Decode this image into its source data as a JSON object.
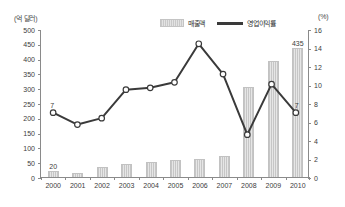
{
  "axis_unit_left": "(억 달러)",
  "axis_unit_right": "(%)",
  "legend": {
    "bar_label": "매출액",
    "line_label": "영업이익률"
  },
  "annotations": {
    "bar_first": "20",
    "bar_last": "435",
    "point_first": "7",
    "point_last": "7"
  },
  "colors": {
    "bar_fill": "#dcdcdc",
    "bar_border": "#c2c2c2",
    "line": "#3a3a3a",
    "marker_fill": "#ffffff",
    "axis": "#8a8a8a",
    "text": "#3c3c3c",
    "background": "#ffffff"
  },
  "chart_data": {
    "type": "bar",
    "title": "",
    "subtitle": "",
    "xlabel": "",
    "ylabel": "(억 달러)",
    "ylabel_secondary": "(%)",
    "grid": false,
    "legend_position": "top",
    "categories": [
      "2000",
      "2001",
      "2002",
      "2003",
      "2004",
      "2005",
      "2006",
      "2007",
      "2008",
      "2009",
      "2010"
    ],
    "ylim": [
      0,
      500
    ],
    "yticks": [
      0,
      50,
      100,
      150,
      200,
      250,
      300,
      350,
      400,
      450,
      500
    ],
    "ylim_secondary": [
      0,
      16
    ],
    "yticks_secondary": [
      0,
      2,
      4,
      6,
      8,
      10,
      12,
      14,
      16
    ],
    "series": [
      {
        "name": "매출액",
        "type": "bar",
        "axis": "left",
        "unit": "억 달러",
        "values": [
          20,
          15,
          35,
          45,
          50,
          58,
          60,
          70,
          305,
          392,
          435
        ],
        "labels": {
          "2000": "20",
          "2010": "435"
        }
      },
      {
        "name": "영업이익률",
        "type": "line",
        "axis": "right",
        "unit": "%",
        "values": [
          7.0,
          5.7,
          6.4,
          9.5,
          9.7,
          10.3,
          14.5,
          11.2,
          4.6,
          10.1,
          7.0
        ],
        "labels": {
          "2000": "7",
          "2010": "7"
        }
      }
    ]
  }
}
